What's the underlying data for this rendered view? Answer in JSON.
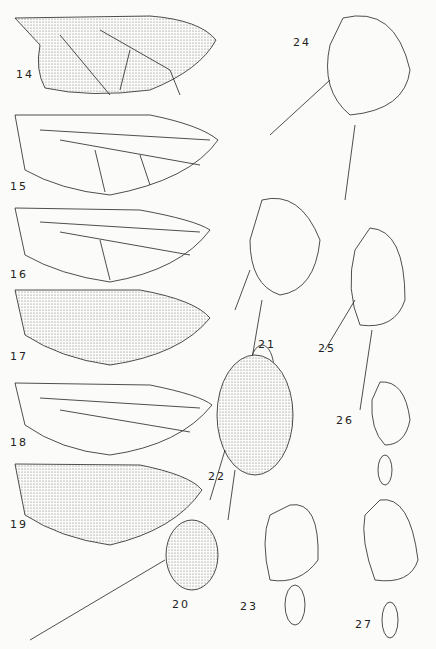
{
  "plate": {
    "figures": [
      {
        "id": "14",
        "type": "wing",
        "label": "14",
        "x": 16,
        "y": 75
      },
      {
        "id": "15",
        "type": "wing",
        "label": "15",
        "x": 10,
        "y": 190
      },
      {
        "id": "16",
        "type": "wing",
        "label": "16",
        "x": 10,
        "y": 277
      },
      {
        "id": "17",
        "type": "wing",
        "label": "17",
        "x": 10,
        "y": 357
      },
      {
        "id": "18",
        "type": "wing",
        "label": "18",
        "x": 10,
        "y": 444
      },
      {
        "id": "19",
        "type": "wing",
        "label": "19",
        "x": 10,
        "y": 525
      },
      {
        "id": "20",
        "type": "head",
        "label": "20",
        "x": 170,
        "y": 610
      },
      {
        "id": "21",
        "type": "head",
        "label": "21",
        "x": 256,
        "y": 348
      },
      {
        "id": "22",
        "type": "head",
        "label": "22",
        "x": 207,
        "y": 479
      },
      {
        "id": "23",
        "type": "head",
        "label": "23",
        "x": 240,
        "y": 608
      },
      {
        "id": "24",
        "type": "head",
        "label": "24",
        "x": 293,
        "y": 42
      },
      {
        "id": "25",
        "type": "head",
        "label": "25",
        "x": 318,
        "y": 351
      },
      {
        "id": "26",
        "type": "head",
        "label": "26",
        "x": 336,
        "y": 421
      },
      {
        "id": "27",
        "type": "head",
        "label": "27",
        "x": 355,
        "y": 625
      }
    ]
  }
}
